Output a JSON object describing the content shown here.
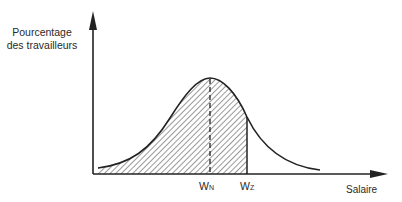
{
  "diagram": {
    "y_axis_label_line1": "Pourcentage",
    "y_axis_label_line2": "des travailleurs",
    "x_axis_label": "Salaire",
    "marker_n": {
      "main": "W",
      "sub": "N"
    },
    "marker_z": {
      "main": "W",
      "sub": "Z"
    }
  }
}
